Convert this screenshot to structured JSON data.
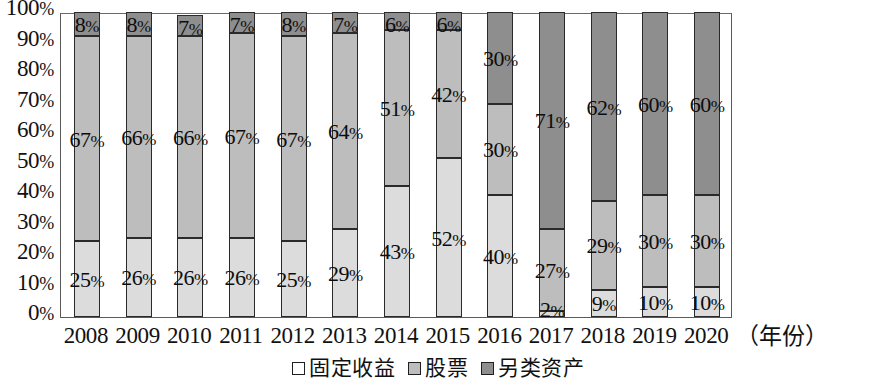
{
  "chart_data": {
    "type": "bar",
    "stacked": true,
    "title": "",
    "xlabel": "（年份）",
    "ylabel": "",
    "ylim": [
      0,
      100
    ],
    "yticks": [
      "0%",
      "10%",
      "20%",
      "30%",
      "40%",
      "50%",
      "60%",
      "70%",
      "80%",
      "90%",
      "100%"
    ],
    "grid": false,
    "legend_position": "bottom",
    "categories": [
      "2008",
      "2009",
      "2010",
      "2011",
      "2012",
      "2013",
      "2014",
      "2015",
      "2016",
      "2017",
      "2018",
      "2019",
      "2020"
    ],
    "series": [
      {
        "name": "固定收益",
        "color": "#dcdcdc",
        "values": [
          25,
          26,
          26,
          26,
          25,
          29,
          43,
          52,
          40,
          2,
          9,
          10,
          10
        ],
        "labels": [
          "25%",
          "26%",
          "26%",
          "26%",
          "25%",
          "29%",
          "43%",
          "52%",
          "40%",
          "2%",
          "9%",
          "10%",
          "10%"
        ]
      },
      {
        "name": "股票",
        "color": "#bdbdbd",
        "values": [
          67,
          66,
          66,
          67,
          67,
          64,
          51,
          42,
          30,
          27,
          29,
          30,
          30
        ],
        "labels": [
          "67%",
          "66%",
          "66%",
          "67%",
          "67%",
          "64%",
          "51%",
          "42%",
          "30%",
          "27%",
          "29%",
          "30%",
          "30%"
        ]
      },
      {
        "name": "另类资产",
        "color": "#8e8e8e",
        "values": [
          8,
          8,
          7,
          7,
          8,
          7,
          6,
          6,
          30,
          71,
          62,
          60,
          60
        ],
        "labels": [
          "8%",
          "8%",
          "7%",
          "7%",
          "8%",
          "7%",
          "6%",
          "6%",
          "30%",
          "71%",
          "62%",
          "60%",
          "60%"
        ]
      }
    ]
  },
  "legend": {
    "items": [
      {
        "label": "固定收益",
        "swatch": "fixed"
      },
      {
        "label": "股票",
        "swatch": "equity"
      },
      {
        "label": "另类资产",
        "swatch": "alt"
      }
    ]
  },
  "axis": {
    "x_unit": "（年份）"
  }
}
